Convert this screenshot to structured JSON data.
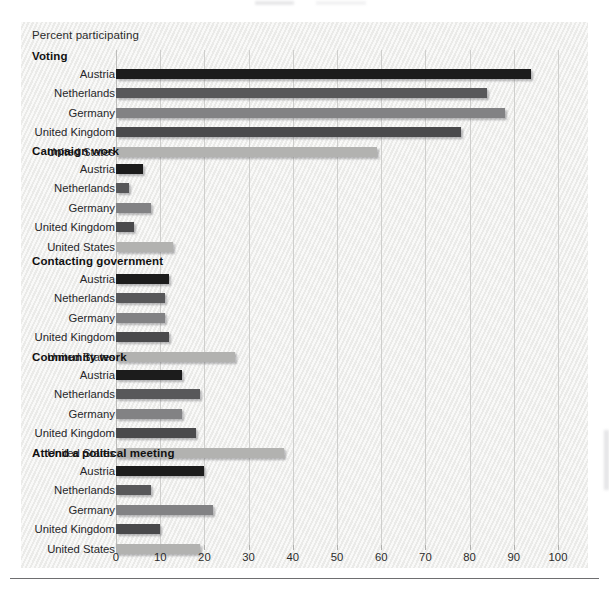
{
  "chart_data": {
    "type": "bar",
    "orientation": "horizontal",
    "title": "",
    "xlabel": "",
    "ylabel": "",
    "axis_title": "Percent participating",
    "xlim": [
      0,
      100
    ],
    "xticks": [
      0,
      10,
      20,
      30,
      40,
      50,
      60,
      70,
      80,
      90,
      100
    ],
    "xtick_labels": [
      "0",
      "10",
      "20",
      "30",
      "40",
      "50",
      "60",
      "70",
      "80",
      "90",
      "100"
    ],
    "grid": true,
    "legend": "none",
    "categories": [
      "Austria",
      "Netherlands",
      "Germany",
      "United Kingdom",
      "United States"
    ],
    "category_colors": [
      "#1c1c1c",
      "#58585a",
      "#828284",
      "#4a4a4c",
      "#b2b2b0"
    ],
    "groups": [
      {
        "name": "Voting",
        "values": [
          94,
          84,
          88,
          78,
          59
        ]
      },
      {
        "name": "Campaign work",
        "values": [
          6,
          3,
          8,
          4,
          13
        ]
      },
      {
        "name": "Contacting government",
        "values": [
          12,
          11,
          11,
          12,
          27
        ]
      },
      {
        "name": "Community work",
        "values": [
          15,
          19,
          15,
          18,
          38
        ]
      },
      {
        "name": "Attend a political meeting",
        "values": [
          20,
          8,
          22,
          10,
          19
        ]
      }
    ]
  },
  "panel": {
    "background": "#f2f2f0",
    "gridline_color": "#c9c9c7",
    "baseline_color": "#6e6e70"
  }
}
